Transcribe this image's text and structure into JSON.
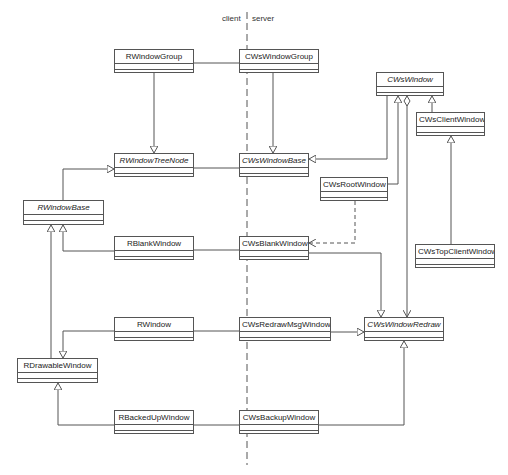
{
  "boundary": {
    "client_label": "client",
    "server_label": "server"
  },
  "classes": {
    "RWindowGroup": {
      "name": "RWindowGroup",
      "abstract": false,
      "x": 114,
      "y": 49,
      "w": 80,
      "h": 24
    },
    "CWsWindowGroup": {
      "name": "CWsWindowGroup",
      "abstract": false,
      "x": 239,
      "y": 49,
      "w": 80,
      "h": 24
    },
    "CWsWindow": {
      "name": "CWsWindow",
      "abstract": true,
      "x": 376,
      "y": 72,
      "w": 68,
      "h": 24
    },
    "CWsClientWindow": {
      "name": "CWsClientWindow",
      "abstract": false,
      "x": 416,
      "y": 112,
      "w": 69,
      "h": 24
    },
    "RWindowTreeNode": {
      "name": "RWindowTreeNode",
      "abstract": true,
      "x": 114,
      "y": 153,
      "w": 80,
      "h": 24
    },
    "CWsWindowBase": {
      "name": "CWsWindowBase",
      "abstract": true,
      "x": 239,
      "y": 153,
      "w": 70,
      "h": 24
    },
    "CWsRootWindow": {
      "name": "CWsRootWindow",
      "abstract": false,
      "x": 320,
      "y": 177,
      "w": 68,
      "h": 24
    },
    "RWindowBase": {
      "name": "RWindowBase",
      "abstract": true,
      "x": 23,
      "y": 200,
      "w": 81,
      "h": 25
    },
    "RBlankWindow": {
      "name": "RBlankWindow",
      "abstract": false,
      "x": 114,
      "y": 236,
      "w": 80,
      "h": 24
    },
    "CWsBlankWindow": {
      "name": "CWsBlankWindow",
      "abstract": false,
      "x": 239,
      "y": 236,
      "w": 70,
      "h": 24
    },
    "CWsTopClientWindow": {
      "name": "CWsTopClientWindow",
      "abstract": false,
      "x": 415,
      "y": 244,
      "w": 80,
      "h": 24
    },
    "RWindow": {
      "name": "RWindow",
      "abstract": false,
      "x": 114,
      "y": 317,
      "w": 80,
      "h": 24
    },
    "CWsRedrawMsgWindow": {
      "name": "CWsRedrawMsgWindow",
      "abstract": false,
      "x": 239,
      "y": 317,
      "w": 92,
      "h": 24
    },
    "CWsWindowRedraw": {
      "name": "CWsWindowRedraw",
      "abstract": true,
      "x": 364,
      "y": 317,
      "w": 80,
      "h": 24
    },
    "RDrawableWindow": {
      "name": "RDrawableWindow",
      "abstract": false,
      "x": 17,
      "y": 358,
      "w": 81,
      "h": 25
    },
    "RBackedUpWindow": {
      "name": "RBackedUpWindow",
      "abstract": false,
      "x": 114,
      "y": 410,
      "w": 80,
      "h": 24
    },
    "CWsBackupWindow": {
      "name": "CWsBackupWindow",
      "abstract": false,
      "x": 239,
      "y": 410,
      "w": 80,
      "h": 24
    }
  },
  "relationships": [
    {
      "from": "RWindowGroup",
      "to": "CWsWindowGroup",
      "type": "association"
    },
    {
      "from": "RWindowGroup",
      "to": "RWindowTreeNode",
      "type": "generalization"
    },
    {
      "from": "CWsWindowGroup",
      "to": "CWsWindowBase",
      "type": "generalization"
    },
    {
      "from": "RWindowTreeNode",
      "to": "CWsWindowBase",
      "type": "association"
    },
    {
      "from": "RWindowBase",
      "to": "RWindowTreeNode",
      "type": "generalization"
    },
    {
      "from": "CWsWindow",
      "to": "CWsWindowBase",
      "type": "generalization"
    },
    {
      "from": "CWsRootWindow",
      "to": "CWsWindow",
      "type": "generalization"
    },
    {
      "from": "CWsClientWindow",
      "to": "CWsWindow",
      "type": "generalization"
    },
    {
      "from": "CWsTopClientWindow",
      "to": "CWsClientWindow",
      "type": "generalization"
    },
    {
      "from": "CWsWindow",
      "to": "CWsWindowRedraw",
      "type": "aggregation"
    },
    {
      "from": "CWsRootWindow",
      "to": "CWsBlankWindow",
      "type": "dependency"
    },
    {
      "from": "RBlankWindow",
      "to": "RWindowBase",
      "type": "generalization"
    },
    {
      "from": "RBlankWindow",
      "to": "CWsBlankWindow",
      "type": "association"
    },
    {
      "from": "CWsBlankWindow",
      "to": "CWsWindowRedraw",
      "type": "generalization"
    },
    {
      "from": "RDrawableWindow",
      "to": "RWindowBase",
      "type": "generalization"
    },
    {
      "from": "RWindow",
      "to": "RDrawableWindow",
      "type": "generalization"
    },
    {
      "from": "RWindow",
      "to": "CWsRedrawMsgWindow",
      "type": "association"
    },
    {
      "from": "CWsRedrawMsgWindow",
      "to": "CWsWindowRedraw",
      "type": "generalization"
    },
    {
      "from": "RBackedUpWindow",
      "to": "RDrawableWindow",
      "type": "generalization"
    },
    {
      "from": "RBackedUpWindow",
      "to": "CWsBackupWindow",
      "type": "association"
    },
    {
      "from": "CWsBackupWindow",
      "to": "CWsWindowRedraw",
      "type": "generalization"
    }
  ]
}
